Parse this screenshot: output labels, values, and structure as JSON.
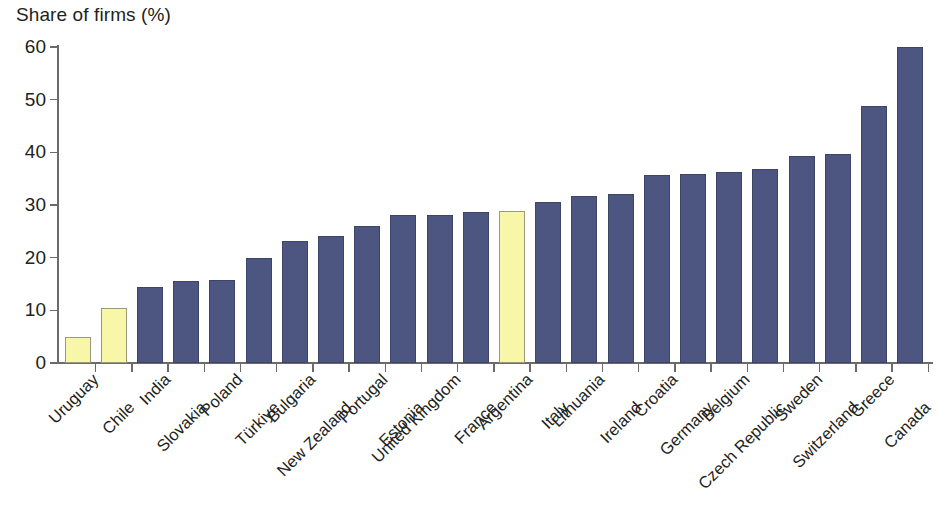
{
  "chart_data": {
    "type": "bar",
    "title": "Share of firms (%)",
    "xlabel": "",
    "ylabel": "Share of firms (%)",
    "ylim": [
      0,
      60
    ],
    "yticks": [
      0,
      10,
      20,
      30,
      40,
      50,
      60
    ],
    "grid": false,
    "legend": "none",
    "bar_colors": {
      "default": "#4c5680",
      "highlight": "#f8f6a9",
      "default_border": "#3c4468",
      "highlight_border": "#9a9a7a"
    },
    "highlighted_categories": [
      "Uruguay",
      "Chile",
      "Argentina"
    ],
    "categories": [
      "Uruguay",
      "Chile",
      "India",
      "Slovakia",
      "Poland",
      "Türkiye",
      "Bulgaria",
      "New Zealand",
      "Portugal",
      "Estonia",
      "United Kingdom",
      "France",
      "Argentina",
      "Italy",
      "Lithuania",
      "Ireland",
      "Croatia",
      "Germany",
      "Belgium",
      "Czech Republic",
      "Sweden",
      "Switzerland",
      "Greece",
      "Canada"
    ],
    "values": [
      4.9,
      10.5,
      14.5,
      15.6,
      15.7,
      19.9,
      23.1,
      24.2,
      26.0,
      28.1,
      28.1,
      28.7,
      28.8,
      30.5,
      31.7,
      32.0,
      35.7,
      35.9,
      36.2,
      36.8,
      39.3,
      39.7,
      48.8,
      60.0
    ],
    "series": [
      {
        "name": "Share of firms (%)",
        "values": [
          4.9,
          10.5,
          14.5,
          15.6,
          15.7,
          19.9,
          23.1,
          24.2,
          26.0,
          28.1,
          28.1,
          28.7,
          28.8,
          30.5,
          31.7,
          32.0,
          35.7,
          35.9,
          36.2,
          36.8,
          39.3,
          39.7,
          48.8,
          60.0
        ]
      }
    ]
  }
}
